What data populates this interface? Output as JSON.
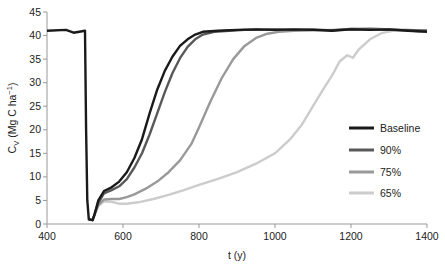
{
  "chart_data": {
    "type": "line",
    "title": "",
    "xlabel": "t (y)",
    "ylabel": "C_V (Mg C ha^-1)",
    "ylabel_parts": {
      "main": "C",
      "sub": "V",
      "rest": " (Mg C ha",
      "sup": "−1",
      "close": ")"
    },
    "xlim": [
      400,
      1400
    ],
    "ylim": [
      0,
      45
    ],
    "xticks": [
      400,
      600,
      800,
      1000,
      1200,
      1400
    ],
    "yticks": [
      0,
      5,
      10,
      15,
      20,
      25,
      30,
      35,
      40,
      45
    ],
    "grid": false,
    "legend_position": "right-middle",
    "series": [
      {
        "name": "Baseline",
        "color": "#1a1a1a",
        "points": [
          [
            400,
            41
          ],
          [
            450,
            41.2
          ],
          [
            470,
            40.6
          ],
          [
            500,
            41
          ],
          [
            503,
            20
          ],
          [
            506,
            5
          ],
          [
            510,
            1
          ],
          [
            520,
            0.8
          ],
          [
            525,
            2
          ],
          [
            535,
            5
          ],
          [
            550,
            7
          ],
          [
            570,
            7.8
          ],
          [
            590,
            9
          ],
          [
            610,
            11
          ],
          [
            630,
            14
          ],
          [
            650,
            18
          ],
          [
            670,
            23.5
          ],
          [
            690,
            28.5
          ],
          [
            710,
            32.5
          ],
          [
            730,
            35.5
          ],
          [
            750,
            37.8
          ],
          [
            770,
            39.2
          ],
          [
            790,
            40.2
          ],
          [
            810,
            40.8
          ],
          [
            850,
            41
          ],
          [
            900,
            41.2
          ],
          [
            950,
            41.3
          ],
          [
            1000,
            41.2
          ],
          [
            1050,
            41.3
          ],
          [
            1100,
            41.2
          ],
          [
            1150,
            41
          ],
          [
            1200,
            41.3
          ],
          [
            1250,
            41.2
          ],
          [
            1300,
            41.3
          ],
          [
            1350,
            41
          ],
          [
            1400,
            40.8
          ]
        ]
      },
      {
        "name": "90%",
        "color": "#595959",
        "points": [
          [
            510,
            1
          ],
          [
            520,
            0.8
          ],
          [
            525,
            2
          ],
          [
            535,
            4.5
          ],
          [
            550,
            6.5
          ],
          [
            570,
            7.2
          ],
          [
            590,
            8
          ],
          [
            610,
            9.5
          ],
          [
            630,
            12
          ],
          [
            650,
            15
          ],
          [
            670,
            19
          ],
          [
            690,
            23.5
          ],
          [
            710,
            28
          ],
          [
            730,
            32
          ],
          [
            750,
            35.2
          ],
          [
            770,
            37.6
          ],
          [
            790,
            39.2
          ],
          [
            810,
            40.2
          ],
          [
            840,
            40.8
          ],
          [
            880,
            41
          ],
          [
            920,
            41.2
          ],
          [
            1000,
            41.3
          ],
          [
            1050,
            41.2
          ],
          [
            1100,
            41.3
          ],
          [
            1150,
            41.1
          ],
          [
            1200,
            41.4
          ],
          [
            1250,
            41.3
          ],
          [
            1300,
            41.2
          ],
          [
            1400,
            41
          ]
        ]
      },
      {
        "name": "75%",
        "color": "#999999",
        "points": [
          [
            510,
            1
          ],
          [
            520,
            0.8
          ],
          [
            525,
            2
          ],
          [
            535,
            4
          ],
          [
            550,
            5.2
          ],
          [
            570,
            5.3
          ],
          [
            590,
            5.3
          ],
          [
            610,
            5.7
          ],
          [
            630,
            6.3
          ],
          [
            660,
            7.5
          ],
          [
            690,
            9
          ],
          [
            720,
            11
          ],
          [
            750,
            13.5
          ],
          [
            780,
            17
          ],
          [
            800,
            20.5
          ],
          [
            830,
            26
          ],
          [
            860,
            31
          ],
          [
            890,
            35
          ],
          [
            920,
            37.8
          ],
          [
            950,
            39.5
          ],
          [
            980,
            40.4
          ],
          [
            1010,
            40.8
          ],
          [
            1050,
            41
          ],
          [
            1100,
            41.1
          ],
          [
            1150,
            41.2
          ],
          [
            1200,
            41.4
          ],
          [
            1250,
            41.5
          ],
          [
            1300,
            41.3
          ],
          [
            1350,
            41.2
          ],
          [
            1400,
            41
          ]
        ]
      },
      {
        "name": "65%",
        "color": "#cccccc",
        "points": [
          [
            510,
            1
          ],
          [
            520,
            0.8
          ],
          [
            525,
            2
          ],
          [
            535,
            3.8
          ],
          [
            550,
            4.8
          ],
          [
            570,
            4.7
          ],
          [
            590,
            4.3
          ],
          [
            610,
            4.3
          ],
          [
            640,
            4.6
          ],
          [
            680,
            5.3
          ],
          [
            720,
            6.2
          ],
          [
            760,
            7.2
          ],
          [
            800,
            8.3
          ],
          [
            850,
            9.6
          ],
          [
            900,
            11
          ],
          [
            950,
            12.8
          ],
          [
            1000,
            15
          ],
          [
            1040,
            18
          ],
          [
            1070,
            21
          ],
          [
            1100,
            25
          ],
          [
            1130,
            29
          ],
          [
            1150,
            31.5
          ],
          [
            1170,
            34.5
          ],
          [
            1190,
            35.8
          ],
          [
            1205,
            35.3
          ],
          [
            1220,
            37
          ],
          [
            1250,
            39.2
          ],
          [
            1280,
            40.5
          ],
          [
            1310,
            41
          ],
          [
            1350,
            41.2
          ],
          [
            1380,
            40.8
          ],
          [
            1400,
            41
          ]
        ]
      }
    ]
  }
}
